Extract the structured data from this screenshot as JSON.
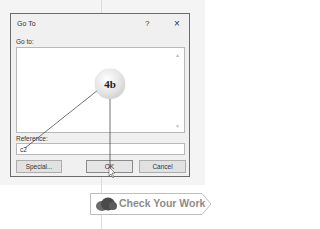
{
  "dialog": {
    "title": "Go To",
    "help_label": "?",
    "close_label": "×",
    "goto_label": "Go to:",
    "scroll_up": "▲",
    "scroll_down": "▼",
    "reference_label": "Reference:",
    "reference_value": "c2",
    "buttons": {
      "special": "Special...",
      "ok": "OK",
      "cancel": "Cancel"
    }
  },
  "callout": {
    "label": "4b"
  },
  "badge": {
    "label": "Check Your Work"
  }
}
